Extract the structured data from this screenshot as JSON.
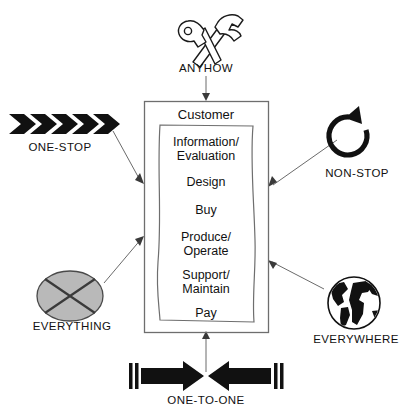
{
  "diagram": {
    "center": {
      "outer_label": "Customer",
      "stages": [
        "Information/\nEvaluation",
        "Design",
        "Buy",
        "Produce/\nOperate",
        "Support/\nMaintain",
        "Pay"
      ],
      "stage_lines": [
        [
          "Information/",
          "Evaluation"
        ],
        [
          "Design"
        ],
        [
          "Buy"
        ],
        [
          "Produce/",
          "Operate"
        ],
        [
          "Support/",
          "Maintain"
        ],
        [
          "Pay"
        ]
      ]
    },
    "nodes": [
      {
        "id": "anyhow",
        "label": "ANYHOW",
        "icon": "wrench-hammer-icon",
        "position": "top"
      },
      {
        "id": "one-stop",
        "label": "ONE-STOP",
        "icon": "chevron-arrows-icon",
        "position": "top-left"
      },
      {
        "id": "non-stop",
        "label": "NON-STOP",
        "icon": "circular-arrow-icon",
        "position": "top-right"
      },
      {
        "id": "everything",
        "label": "EVERYTHING",
        "icon": "crossed-circle-icon",
        "position": "bottom-left"
      },
      {
        "id": "everywhere",
        "label": "EVERYWHERE",
        "icon": "globe-icon",
        "position": "bottom-right"
      },
      {
        "id": "one-to-one",
        "label": "ONE-TO-ONE",
        "icon": "opposing-arrows-icon",
        "position": "bottom"
      }
    ],
    "colors": {
      "line": "#5a5a5a",
      "ink": "#111111",
      "fill_gray": "#b9b9b9",
      "background": "#ffffff"
    }
  }
}
